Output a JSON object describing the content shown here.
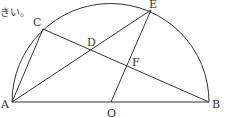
{
  "header_text": "きい。",
  "diagram": {
    "type": "geometry",
    "shape": "semicircle",
    "center": "O",
    "diameter": [
      "A",
      "B"
    ],
    "points": {
      "A": {
        "label": "A",
        "x": 12,
        "y": 102
      },
      "B": {
        "label": "B",
        "x": 209,
        "y": 102
      },
      "O": {
        "label": "O",
        "x": 111,
        "y": 102
      },
      "C": {
        "label": "C",
        "x": 43,
        "y": 29
      },
      "D": {
        "label": "D",
        "x": 92,
        "y": 50
      },
      "E": {
        "label": "E",
        "x": 151,
        "y": 10
      },
      "F": {
        "label": "F",
        "x": 127,
        "y": 68
      }
    },
    "segments": [
      [
        "A",
        "B"
      ],
      [
        "A",
        "C"
      ],
      [
        "C",
        "B"
      ],
      [
        "A",
        "E"
      ],
      [
        "O",
        "E"
      ]
    ],
    "stroke_color": "#333333"
  }
}
